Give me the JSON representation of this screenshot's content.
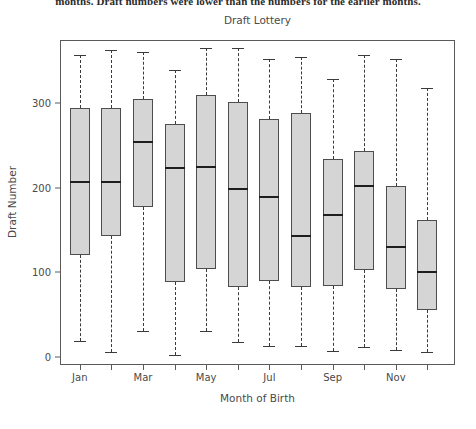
{
  "page": {
    "clipped_text": "months. Draft numbers were lower than the numbers for the earlier months."
  },
  "chart_data": {
    "type": "box",
    "title": "Draft Lottery",
    "xlabel": "Month of Birth",
    "ylabel": "Draft Number",
    "ylim": [
      -10,
      375
    ],
    "yticks": [
      0,
      100,
      200,
      300
    ],
    "ytick_labels": [
      "0",
      "100",
      "200",
      "300"
    ],
    "grid": false,
    "legend": null,
    "categories": [
      "Jan",
      "Feb",
      "Mar",
      "Apr",
      "May",
      "Jun",
      "Jul",
      "Aug",
      "Sep",
      "Oct",
      "Nov",
      "Dec"
    ],
    "xtick_labels": [
      "Jan",
      "Mar",
      "May",
      "Jul",
      "Sep",
      "Nov"
    ],
    "box_fill": "#d5d5d5",
    "box_edge": "#4d4d4d",
    "median_color": "#1e1e1e",
    "whisker_style": "dashed",
    "boxes": [
      {
        "category": "Jan",
        "whisker_low": 18,
        "q1": 120,
        "median": 207,
        "q3": 295,
        "whisker_high": 357
      },
      {
        "category": "Feb",
        "whisker_low": 5,
        "q1": 143,
        "median": 207,
        "q3": 295,
        "whisker_high": 363
      },
      {
        "category": "Mar",
        "whisker_low": 30,
        "q1": 177,
        "median": 254,
        "q3": 305,
        "whisker_high": 361
      },
      {
        "category": "Apr",
        "whisker_low": 2,
        "q1": 88,
        "median": 223,
        "q3": 275,
        "whisker_high": 340
      },
      {
        "category": "May",
        "whisker_low": 30,
        "q1": 104,
        "median": 224,
        "q3": 310,
        "whisker_high": 366
      },
      {
        "category": "Jun",
        "whisker_low": 17,
        "q1": 82,
        "median": 198,
        "q3": 301,
        "whisker_high": 366
      },
      {
        "category": "Jul",
        "whisker_low": 13,
        "q1": 89,
        "median": 189,
        "q3": 281,
        "whisker_high": 353
      },
      {
        "category": "Aug",
        "whisker_low": 12,
        "q1": 82,
        "median": 143,
        "q3": 289,
        "whisker_high": 355
      },
      {
        "category": "Sep",
        "whisker_low": 7,
        "q1": 84,
        "median": 168,
        "q3": 234,
        "whisker_high": 329
      },
      {
        "category": "Oct",
        "whisker_low": 11,
        "q1": 103,
        "median": 202,
        "q3": 244,
        "whisker_high": 357
      },
      {
        "category": "Nov",
        "whisker_low": 8,
        "q1": 80,
        "median": 130,
        "q3": 202,
        "whisker_high": 352
      },
      {
        "category": "Dec",
        "whisker_low": 5,
        "q1": 55,
        "median": 100,
        "q3": 162,
        "whisker_high": 318
      }
    ]
  }
}
